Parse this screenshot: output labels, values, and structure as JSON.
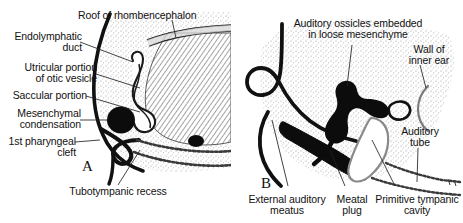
{
  "figure": {
    "background_color": "#ffffff",
    "ink_color": "#111111",
    "stipple_color": "#9a9a9a",
    "hatch_color": "#6e6e6e",
    "leader_color": "#222222"
  },
  "panels": [
    {
      "id": "A",
      "letter": "A"
    },
    {
      "id": "B",
      "letter": "B"
    }
  ],
  "labels_panel_a": [
    {
      "id": "roof-of-rhombencephalon",
      "text": "Roof of rhombencephalon",
      "align": "left"
    },
    {
      "id": "endolymphatic-duct",
      "line1": "Endolymphatic",
      "line2": "duct",
      "align": "right"
    },
    {
      "id": "utricular-portion-of-otic-vesicle",
      "line1": "Utricular portion",
      "line2": "of otic vesicle",
      "align": "right"
    },
    {
      "id": "saccular-portion",
      "text": "Saccular portion",
      "align": "right"
    },
    {
      "id": "mesenchymal-condensation",
      "line1": "Mesenchymal",
      "line2": "condensation",
      "align": "right"
    },
    {
      "id": "first-pharyngeal-cleft",
      "line1": "1st pharyngeal",
      "line2": "cleft",
      "align": "right"
    },
    {
      "id": "tubotympanic-recess",
      "text": "Tubotympanic recess",
      "align": "center"
    }
  ],
  "labels_panel_b": [
    {
      "id": "auditory-ossicles-embedded-in-loose-mesenchyme",
      "line1": "Auditory ossicles embedded",
      "line2": "in loose mesenchyme",
      "align": "center"
    },
    {
      "id": "wall-of-inner-ear",
      "line1": "Wall of",
      "line2": "inner ear",
      "align": "center"
    },
    {
      "id": "auditory-tube",
      "line1": "Auditory",
      "line2": "tube",
      "align": "center"
    },
    {
      "id": "external-auditory-meatus",
      "line1": "External auditory",
      "line2": "meatus",
      "align": "center"
    },
    {
      "id": "meatal-plug",
      "line1": "Meatal",
      "line2": "plug",
      "align": "center"
    },
    {
      "id": "primitive-tympanic-cavity",
      "line1": "Primitive tympanic",
      "line2": "cavity",
      "align": "center"
    }
  ]
}
